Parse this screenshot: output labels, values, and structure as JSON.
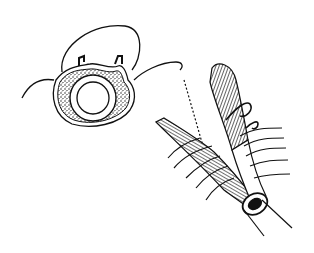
{
  "figure": {
    "kind": "medical line illustration",
    "background": "#ffffff",
    "ink": "#111111",
    "panels": [
      {
        "id": "left",
        "depicts": "cross-section of tubular structure with inner ring, speckled wall and two suture hooks"
      },
      {
        "id": "right",
        "depicts": "rolled/tubular tissue being sutured with multiple stitches and curved needles"
      }
    ]
  }
}
